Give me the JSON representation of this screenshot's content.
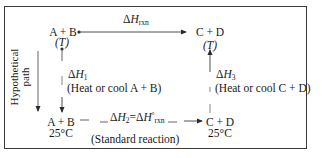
{
  "diagram": {
    "type": "thermochemical-cycle",
    "nodes": {
      "top_left": {
        "species": "A + B",
        "condition": "(T)"
      },
      "top_right": {
        "species": "C + D",
        "condition": "(T)"
      },
      "bottom_left": {
        "species": "A + B",
        "condition": "25°C"
      },
      "bottom_right": {
        "species": "C + D",
        "condition": "25°C"
      }
    },
    "edges": {
      "top": {
        "symbol": "ΔH",
        "subscript": "rxn",
        "from": "top_left",
        "to": "top_right"
      },
      "left": {
        "symbol": "ΔH",
        "subscript": "1",
        "note": "(Heat or cool A + B)",
        "from": "top_left",
        "to": "bottom_left"
      },
      "bottom": {
        "symbol_a": "ΔH",
        "subscript_a": "2",
        "equals": "=",
        "symbol_b": "ΔH",
        "superscript_b": "°",
        "subscript_b": "rxn",
        "note": "(Standard reaction)",
        "from": "bottom_left",
        "to": "bottom_right"
      },
      "right": {
        "symbol": "ΔH",
        "subscript": "3",
        "note": "(Heat or cool C + D)",
        "from": "bottom_right",
        "to": "top_right"
      }
    },
    "side_label": {
      "line1": "Hypothetical",
      "line2": "path"
    },
    "colors": {
      "line": "#3a3a3a",
      "text": "#1a1a1a",
      "background": "#ffffff"
    }
  }
}
